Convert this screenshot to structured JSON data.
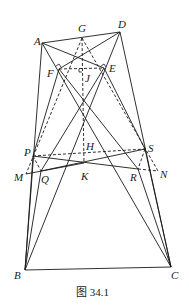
{
  "figure": {
    "caption": "图 34.1",
    "points": {
      "A": {
        "label": "A",
        "x": 42,
        "y": 43
      },
      "D": {
        "label": "D",
        "x": 120,
        "y": 32
      },
      "G": {
        "label": "G",
        "x": 82,
        "y": 38
      },
      "F": {
        "label": "F",
        "x": 59,
        "y": 69
      },
      "E": {
        "label": "E",
        "x": 104,
        "y": 68
      },
      "J": {
        "label": "J",
        "x": 82,
        "y": 71
      },
      "P": {
        "label": "P",
        "x": 33,
        "y": 156
      },
      "S": {
        "label": "S",
        "x": 145,
        "y": 149
      },
      "H": {
        "label": "H",
        "x": 84,
        "y": 152
      },
      "M": {
        "label": "M",
        "x": 26,
        "y": 174
      },
      "Q": {
        "label": "Q",
        "x": 41,
        "y": 171
      },
      "K": {
        "label": "K",
        "x": 84,
        "y": 163
      },
      "R": {
        "label": "R",
        "x": 138,
        "y": 169
      },
      "N": {
        "label": "N",
        "x": 158,
        "y": 171
      },
      "B": {
        "label": "B",
        "x": 25,
        "y": 270
      },
      "C": {
        "label": "C",
        "x": 171,
        "y": 267
      }
    }
  }
}
